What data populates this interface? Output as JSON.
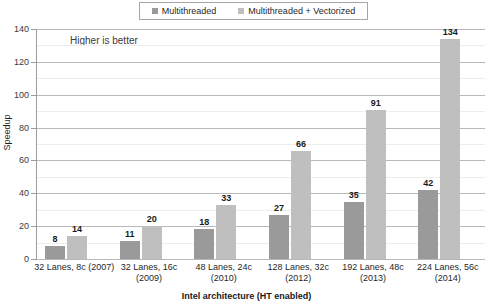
{
  "chart_data": {
    "type": "bar",
    "title": "",
    "xlabel": "Intel architecture (HT enabled)",
    "ylabel": "Speedup",
    "ylim": [
      0,
      140
    ],
    "ytick_step": 20,
    "yminor_step": 10,
    "grid": true,
    "legend_position": "top-center",
    "annotation": "Higher is better",
    "categories": [
      "32 Lanes, 8c (2007)",
      "32 Lanes, 16c (2009)",
      "48 Lanes, 24c (2010)",
      "128 Lanes, 32c (2012)",
      "192 Lanes, 48c (2013)",
      "224 Lanes, 56c (2014)"
    ],
    "category_lines": [
      [
        "32 Lanes, 8c (2007)"
      ],
      [
        "32 Lanes, 16c",
        "(2009)"
      ],
      [
        "48 Lanes, 24c",
        "(2010)"
      ],
      [
        "128 Lanes, 32c",
        "(2012)"
      ],
      [
        "192 Lanes, 48c",
        "(2013)"
      ],
      [
        "224 Lanes, 56c",
        "(2014)"
      ]
    ],
    "yticks": [
      "0",
      "20",
      "40",
      "60",
      "80",
      "100",
      "120",
      "140"
    ],
    "series": [
      {
        "name": "Multithreaded",
        "color": "#9a9a9a",
        "values": [
          8,
          11,
          18,
          27,
          35,
          42
        ]
      },
      {
        "name": "Multithreaded + Vectorized",
        "color": "#bfbfbf",
        "values": [
          14,
          20,
          33,
          66,
          91,
          134
        ]
      }
    ]
  },
  "legend": {
    "items": [
      {
        "label": "Multithreaded",
        "color": "#9a9a9a"
      },
      {
        "label": "Multithreaded + Vectorized",
        "color": "#bfbfbf"
      }
    ]
  }
}
